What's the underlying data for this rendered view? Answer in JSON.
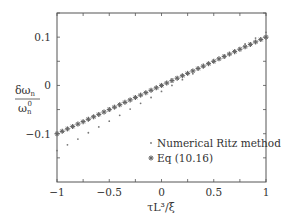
{
  "chart_data": {
    "type": "scatter",
    "title": "",
    "xlabel": "τL³/ξ",
    "ylabel": "δω_n / ω_n^0",
    "ylabel_num": "δω",
    "ylabel_num_sub": "n",
    "ylabel_den": "ω",
    "ylabel_den_sub": "n",
    "ylabel_den_sup": "0",
    "xlim": [
      -1,
      1
    ],
    "ylim": [
      -0.2,
      0.15
    ],
    "xticks": [
      -1,
      -0.5,
      0,
      0.5,
      1
    ],
    "xtick_labels": [
      "−1",
      "−0.5",
      "0",
      "0.5",
      "1"
    ],
    "yticks": [
      -0.1,
      0,
      0.1
    ],
    "ytick_labels": [
      "−0.1",
      "0",
      "0.1"
    ],
    "grid": false,
    "legend_position": "lower right",
    "series": [
      {
        "name": "Numerical Ritz method",
        "marker": "dot",
        "x": [
          -1,
          -0.9,
          -0.8,
          -0.7,
          -0.6,
          -0.5,
          -0.4,
          -0.3,
          -0.2,
          -0.1,
          0,
          0.1,
          0.2,
          0.3,
          0.4,
          0.5,
          0.6,
          0.7,
          0.8,
          0.9,
          1
        ],
        "y": [
          -0.135,
          -0.123,
          -0.111,
          -0.098,
          -0.086,
          -0.074,
          -0.062,
          -0.049,
          -0.037,
          -0.025,
          -0.0125,
          0.0,
          0.012,
          0.024,
          0.037,
          0.049,
          0.061,
          0.073,
          0.086,
          0.098,
          0.11
        ]
      },
      {
        "name": "Eq (10.16)",
        "marker": "star",
        "x": [
          -1,
          -0.95,
          -0.9,
          -0.85,
          -0.8,
          -0.75,
          -0.7,
          -0.65,
          -0.6,
          -0.55,
          -0.5,
          -0.45,
          -0.4,
          -0.35,
          -0.3,
          -0.25,
          -0.2,
          -0.15,
          -0.1,
          -0.05,
          0,
          0.05,
          0.1,
          0.15,
          0.2,
          0.25,
          0.3,
          0.35,
          0.4,
          0.45,
          0.5,
          0.55,
          0.6,
          0.65,
          0.7,
          0.75,
          0.8,
          0.85,
          0.9,
          0.95,
          1
        ],
        "y": [
          -0.1,
          -0.095,
          -0.09,
          -0.085,
          -0.08,
          -0.075,
          -0.07,
          -0.065,
          -0.06,
          -0.055,
          -0.05,
          -0.045,
          -0.04,
          -0.035,
          -0.03,
          -0.025,
          -0.02,
          -0.015,
          -0.01,
          -0.005,
          0,
          0.005,
          0.01,
          0.015,
          0.02,
          0.025,
          0.03,
          0.035,
          0.04,
          0.045,
          0.05,
          0.055,
          0.06,
          0.065,
          0.07,
          0.075,
          0.08,
          0.085,
          0.09,
          0.095,
          0.1
        ]
      }
    ]
  },
  "legend": {
    "items": [
      {
        "label": "Numerical Ritz method"
      },
      {
        "label": "Eq (10.16)"
      }
    ]
  },
  "colors": {
    "axis": "#555555",
    "ritz": "#777777",
    "eq": "#666666"
  }
}
